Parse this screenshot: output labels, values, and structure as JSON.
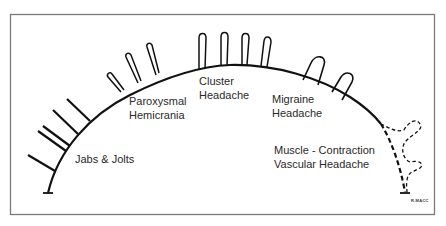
{
  "diagram": {
    "type": "headache-spectrum-arc",
    "colors": {
      "frame": "#7a7a7a",
      "stroke": "#111111",
      "text": "#2a2a2a",
      "background": "#ffffff"
    },
    "labels": {
      "jabs": "Jabs & Jolts",
      "paroxysmal_line1": "Paroxysmal",
      "paroxysmal_line2": "Hemicrania",
      "cluster_line1": "Cluster",
      "cluster_line2": "Headache",
      "migraine_line1": "Migraine",
      "migraine_line2": "Headache",
      "muscle_line1": "Muscle - Contraction",
      "muscle_line2": "Vascular Headache"
    },
    "signature": "R.MACC"
  }
}
